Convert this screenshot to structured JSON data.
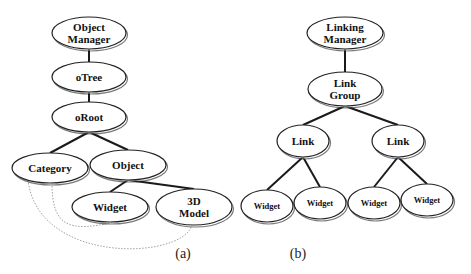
{
  "diagram_a": {
    "caption": "(a)",
    "nodes": {
      "object_manager": [
        "Object",
        "Manager"
      ],
      "otree": [
        "oTree"
      ],
      "oroot": [
        "oRoot"
      ],
      "category": [
        "Category"
      ],
      "object": [
        "Object"
      ],
      "widget": [
        "Widget"
      ],
      "model3d": [
        "3D",
        "Model"
      ]
    },
    "edges": [
      [
        "object_manager",
        "otree"
      ],
      [
        "otree",
        "oroot"
      ],
      [
        "oroot",
        "category"
      ],
      [
        "oroot",
        "object"
      ],
      [
        "object",
        "widget"
      ],
      [
        "object",
        "model3d"
      ]
    ],
    "dotted_links": [
      [
        "category",
        "widget"
      ],
      [
        "category",
        "model3d"
      ]
    ]
  },
  "diagram_b": {
    "caption": "(b)",
    "nodes": {
      "linking_manager": [
        "Linking",
        "Manager"
      ],
      "link_group": [
        "Link",
        "Group"
      ],
      "link_left": [
        "Link"
      ],
      "link_right": [
        "Link"
      ],
      "widget_1": [
        "Widget"
      ],
      "widget_2": [
        "Widget"
      ],
      "widget_3": [
        "Widget"
      ],
      "widget_4": [
        "Widget"
      ]
    },
    "edges": [
      [
        "linking_manager",
        "link_group"
      ],
      [
        "link_group",
        "link_left"
      ],
      [
        "link_group",
        "link_right"
      ],
      [
        "link_left",
        "widget_1"
      ],
      [
        "link_left",
        "widget_2"
      ],
      [
        "link_right",
        "widget_3"
      ],
      [
        "link_right",
        "widget_4"
      ]
    ]
  }
}
